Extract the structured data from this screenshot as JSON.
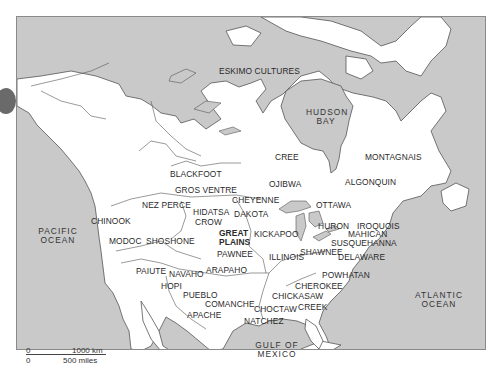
{
  "map": {
    "title": "",
    "colors": {
      "water": "#c9c9c9",
      "land": "#ffffff",
      "border": "#555555",
      "bullet": "#6a6a6a"
    },
    "water_labels": [
      {
        "id": "hudson-bay",
        "lines": [
          "HUDSON",
          "BAY"
        ],
        "x": 305,
        "y": 107
      },
      {
        "id": "pacific-ocean",
        "lines": [
          "PACIFIC",
          "OCEAN"
        ],
        "x": 40,
        "y": 227
      },
      {
        "id": "atlantic-ocean",
        "lines": [
          "ATLANTIC",
          "OCEAN"
        ],
        "x": 417,
        "y": 290
      },
      {
        "id": "gulf-of-mexico",
        "lines": [
          "GULF OF",
          "MEXICO"
        ],
        "x": 259,
        "y": 341
      }
    ],
    "culture_labels": [
      {
        "id": "eskimo-cultures",
        "text": "ESKIMO CULTURES",
        "x": 219,
        "y": 67
      },
      {
        "id": "montagnais",
        "text": "MONTAGNAIS",
        "x": 365,
        "y": 153
      },
      {
        "id": "cree",
        "text": "CREE",
        "x": 275,
        "y": 153
      },
      {
        "id": "algonquin",
        "text": "ALGONQUIN",
        "x": 345,
        "y": 178
      },
      {
        "id": "blackfoot",
        "text": "BLACKFOOT",
        "x": 170,
        "y": 170
      },
      {
        "id": "ojibwa",
        "text": "OJIBWA",
        "x": 269,
        "y": 180
      },
      {
        "id": "gros-ventre",
        "text": "GROS VENTRE",
        "x": 175,
        "y": 186
      },
      {
        "id": "cheyenne",
        "text": "CHEYENNE",
        "x": 232,
        "y": 196
      },
      {
        "id": "ottawa",
        "text": "OTTAWA",
        "x": 316,
        "y": 201
      },
      {
        "id": "nez-perce",
        "text": "NEZ PERCE",
        "x": 142,
        "y": 201
      },
      {
        "id": "hidatsa",
        "text": "HIDATSA",
        "x": 193,
        "y": 208
      },
      {
        "id": "dakota",
        "text": "DAKOTA",
        "x": 234,
        "y": 210
      },
      {
        "id": "chinook",
        "text": "CHINOOK",
        "x": 91,
        "y": 217
      },
      {
        "id": "crow",
        "text": "CROW",
        "x": 195,
        "y": 218
      },
      {
        "id": "huron",
        "text": "HURON",
        "x": 318,
        "y": 222
      },
      {
        "id": "iroquois",
        "text": "IROQUOIS",
        "x": 357,
        "y": 222
      },
      {
        "id": "great-plains",
        "text": "GREAT",
        "text2": "PLAINS",
        "x": 219,
        "y": 229
      },
      {
        "id": "kickapoo",
        "text": "KICKAPOO",
        "x": 254,
        "y": 230
      },
      {
        "id": "mahican",
        "text": "MAHICAN",
        "x": 348,
        "y": 230
      },
      {
        "id": "modoc",
        "text": "MODOC",
        "x": 109,
        "y": 237
      },
      {
        "id": "shoshone",
        "text": "SHOSHONE",
        "x": 146,
        "y": 237
      },
      {
        "id": "susquehanna",
        "text": "SUSQUEHANNA",
        "x": 331,
        "y": 239
      },
      {
        "id": "shawnee",
        "text": "SHAWNEE",
        "x": 300,
        "y": 248
      },
      {
        "id": "pawnee",
        "text": "PAWNEE",
        "x": 217,
        "y": 250
      },
      {
        "id": "illinois",
        "text": "ILLINOIS",
        "x": 269,
        "y": 253
      },
      {
        "id": "delaware",
        "text": "DELAWARE",
        "x": 338,
        "y": 253
      },
      {
        "id": "paiute",
        "text": "PAIUTE",
        "x": 136,
        "y": 267
      },
      {
        "id": "arapaho",
        "text": "ARAPAHO",
        "x": 206,
        "y": 266
      },
      {
        "id": "navaho",
        "text": "NAVAHO",
        "x": 169,
        "y": 270
      },
      {
        "id": "powhatan",
        "text": "POWHATAN",
        "x": 322,
        "y": 271
      },
      {
        "id": "hopi",
        "text": "HOPI",
        "x": 161,
        "y": 282
      },
      {
        "id": "cherokee",
        "text": "CHEROKEE",
        "x": 295,
        "y": 282
      },
      {
        "id": "pueblo",
        "text": "PUEBLO",
        "x": 183,
        "y": 291
      },
      {
        "id": "chickasaw",
        "text": "CHICKASAW",
        "x": 272,
        "y": 292
      },
      {
        "id": "comanche",
        "text": "COMANCHE",
        "x": 205,
        "y": 300
      },
      {
        "id": "choctaw",
        "text": "CHOCTAW",
        "x": 254,
        "y": 305
      },
      {
        "id": "creek",
        "text": "CREEK",
        "x": 298,
        "y": 303
      },
      {
        "id": "apache",
        "text": "APACHE",
        "x": 187,
        "y": 311
      },
      {
        "id": "natchez",
        "text": "NATCHEZ",
        "x": 244,
        "y": 317
      }
    ],
    "scale_bar": {
      "km_zero": "0",
      "km_label": "1000 km",
      "mi_zero": "0",
      "mi_label": "500 miles"
    }
  }
}
